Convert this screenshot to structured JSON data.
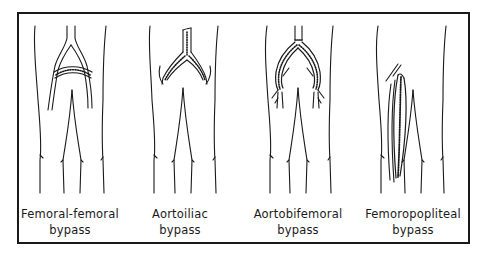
{
  "figure": {
    "panels": [
      {
        "id": "femoral-femoral",
        "line1": "Femoral-femoral",
        "line2": "bypass",
        "center_x": 70
      },
      {
        "id": "aortoiliac",
        "line1": "Aortoiliac",
        "line2": "bypass",
        "center_x": 180
      },
      {
        "id": "aortobifemoral",
        "line1": "Aortobifemoral",
        "line2": "bypass",
        "center_x": 298
      },
      {
        "id": "femoropopliteal",
        "line1": "Femoropopliteal",
        "line2": "bypass",
        "center_x": 413
      }
    ],
    "colors": {
      "ink": "#1a1a1a",
      "background": "#ffffff"
    }
  }
}
